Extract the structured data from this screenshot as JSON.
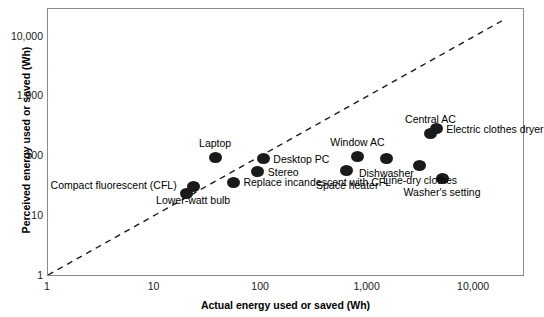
{
  "chart_data": {
    "type": "scatter",
    "title": "",
    "xlabel": "Actual energy used or saved (Wh)",
    "ylabel": "Perceived energy used or saved (Wh)",
    "xscale": "log",
    "yscale": "log",
    "xlim": [
      1,
      30000
    ],
    "ylim": [
      1,
      30000
    ],
    "grid": false,
    "legend": "none",
    "xticks": [
      "1",
      "10",
      "100",
      "1,000",
      "10,000"
    ],
    "xtick_values": [
      1,
      10,
      100,
      1000,
      10000
    ],
    "yticks": [
      "1",
      "10",
      "100",
      "1,000",
      "10,000"
    ],
    "ytick_values": [
      1,
      10,
      100,
      1000,
      10000
    ],
    "reference_line": {
      "name": "identity-line",
      "style": "dashed",
      "description": "y = x diagonal",
      "from": [
        1,
        1
      ],
      "to": [
        20000,
        20000
      ]
    },
    "points": [
      {
        "label": "Compact fluorescent (CFL)",
        "x": 20,
        "y": 25,
        "label_pos": "left"
      },
      {
        "label": "Lower-watt bulb",
        "x": 23,
        "y": 33,
        "label_pos": "below"
      },
      {
        "label": "Laptop",
        "x": 37,
        "y": 100,
        "label_pos": "above"
      },
      {
        "label": "Replace incandescent with CFL",
        "x": 55,
        "y": 38,
        "label_pos": "right"
      },
      {
        "label": "Stereo",
        "x": 93,
        "y": 57,
        "label_pos": "right"
      },
      {
        "label": "Desktop PC",
        "x": 105,
        "y": 95,
        "label_pos": "right"
      },
      {
        "label": "Space heater",
        "x": 640,
        "y": 60,
        "label_pos": "below"
      },
      {
        "label": "Window AC",
        "x": 800,
        "y": 105,
        "label_pos": "above"
      },
      {
        "label": "Dishwasher",
        "x": 1500,
        "y": 95,
        "label_pos": "below"
      },
      {
        "label": "Line-dry clothes",
        "x": 3100,
        "y": 72,
        "label_pos": "below"
      },
      {
        "label": "Central AC",
        "x": 3900,
        "y": 250,
        "label_pos": "above"
      },
      {
        "label": "Electric clothes dryer",
        "x": 4400,
        "y": 300,
        "label_pos": "right"
      },
      {
        "label": "Washer's setting",
        "x": 5000,
        "y": 45,
        "label_pos": "below"
      }
    ]
  }
}
